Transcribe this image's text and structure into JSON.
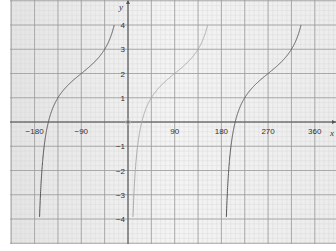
{
  "chart_data": {
    "type": "line",
    "title": "",
    "function": "y = tan(x - 90) + 2",
    "xlabel": "x",
    "ylabel": "y",
    "xlim": [
      -225,
      405
    ],
    "ylim": [
      -5,
      5
    ],
    "grid": true,
    "x_ticks": [
      -180,
      -90,
      90,
      180,
      270,
      360
    ],
    "x_tick_labels": [
      "−180",
      "−90",
      "90",
      "180",
      "270",
      "360"
    ],
    "y_ticks": [
      4,
      3,
      2,
      1,
      -1,
      -2,
      -3,
      -4
    ],
    "y_tick_labels": [
      "4",
      "3",
      "2",
      "1",
      "−1",
      "−2",
      "−3",
      "−4"
    ],
    "series": [
      {
        "name": "branch 1",
        "x_range": [
          -180,
          0
        ],
        "color": "#555555",
        "points": [
          [
            -176.4,
            -4
          ],
          [
            -135,
            1
          ],
          [
            -90,
            2
          ],
          [
            -45,
            3
          ],
          [
            -3.6,
            4
          ]
        ]
      },
      {
        "name": "branch 2",
        "x_range": [
          0,
          180
        ],
        "color": "#aaaaaa",
        "points": [
          [
            3.6,
            -4
          ],
          [
            45,
            1
          ],
          [
            90,
            2
          ],
          [
            135,
            3
          ],
          [
            176.4,
            4
          ]
        ]
      },
      {
        "name": "branch 3",
        "x_range": [
          180,
          360
        ],
        "color": "#555555",
        "points": [
          [
            183.6,
            -4
          ],
          [
            225,
            1
          ],
          [
            270,
            2
          ],
          [
            315,
            3
          ],
          [
            356.4,
            4
          ]
        ]
      }
    ]
  },
  "colors": {
    "background": "#ebebeb",
    "grid_major": "#9a9a9a",
    "grid_minor": "#d6d6d6",
    "axis": "#555555"
  }
}
